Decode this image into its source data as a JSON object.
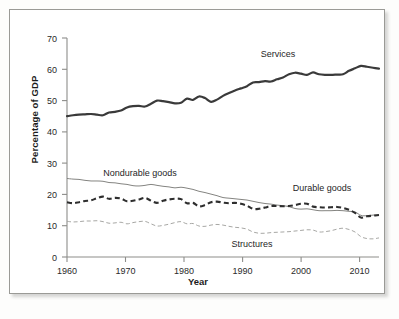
{
  "figure": {
    "title": "",
    "y_axis_title": "Percentage of GDP",
    "x_axis_title": "Year"
  },
  "labels": {
    "services": "Services",
    "nondurable": "Nondurable goods",
    "durable": "Durable goods",
    "structures": "Structures"
  },
  "colors": {
    "services_line": "#3a3a3a",
    "durable_line": "#2e2e2e",
    "nondurable_line": "#848481",
    "structures_line": "#9d9d9a",
    "axis": "#8d8d8a",
    "frame_border": "#9a9a96",
    "background": "#ffffff"
  },
  "axes": {
    "y_ticks": [
      "0",
      "10",
      "20",
      "30",
      "40",
      "50",
      "60",
      "70"
    ],
    "x_ticks": [
      "1960",
      "1970",
      "1980",
      "1990",
      "2000",
      "2010"
    ]
  },
  "chart_data": {
    "type": "line",
    "title": "",
    "xlabel": "Year",
    "ylabel": "Percentage of GDP",
    "xlim": [
      1960,
      2012
    ],
    "ylim": [
      0,
      70
    ],
    "grid": false,
    "legend": "inline-annotations",
    "x": [
      1960,
      1961,
      1962,
      1963,
      1964,
      1965,
      1966,
      1967,
      1968,
      1969,
      1970,
      1971,
      1972,
      1973,
      1974,
      1975,
      1976,
      1977,
      1978,
      1979,
      1980,
      1981,
      1982,
      1983,
      1984,
      1985,
      1986,
      1987,
      1988,
      1989,
      1990,
      1991,
      1992,
      1993,
      1994,
      1995,
      1996,
      1997,
      1998,
      1999,
      2000,
      2001,
      2002,
      2003,
      2004,
      2005,
      2006,
      2007,
      2008,
      2009,
      2010,
      2011,
      2012
    ],
    "series": [
      {
        "name": "Services",
        "style": "thick-solid",
        "values": [
          45.0,
          45.3,
          45.5,
          45.6,
          45.7,
          45.5,
          45.3,
          46.2,
          46.4,
          46.8,
          47.8,
          48.2,
          48.3,
          48.1,
          49.0,
          50.0,
          49.8,
          49.5,
          49.1,
          49.3,
          50.6,
          50.2,
          51.3,
          50.8,
          49.6,
          50.3,
          51.5,
          52.4,
          53.2,
          53.9,
          54.6,
          55.8,
          55.9,
          56.2,
          56.1,
          56.8,
          57.4,
          58.4,
          58.9,
          58.6,
          58.2,
          59.0,
          58.4,
          58.2,
          58.2,
          58.3,
          58.4,
          59.5,
          60.3,
          61.1,
          60.8,
          60.5,
          60.2
        ]
      },
      {
        "name": "Nondurable goods",
        "style": "thin-solid",
        "values": [
          25.1,
          24.9,
          24.8,
          24.5,
          24.3,
          24.3,
          24.2,
          23.8,
          23.7,
          23.4,
          23.2,
          22.8,
          22.7,
          22.9,
          23.2,
          22.9,
          22.6,
          22.4,
          22.1,
          22.3,
          22.0,
          21.6,
          21.0,
          20.6,
          20.1,
          19.6,
          19.0,
          18.8,
          18.6,
          18.4,
          18.2,
          17.8,
          17.4,
          17.1,
          16.9,
          16.6,
          16.4,
          16.1,
          15.5,
          15.3,
          15.4,
          15.1,
          14.8,
          14.8,
          14.8,
          14.9,
          14.8,
          14.6,
          14.4,
          13.3,
          13.2,
          13.4,
          13.5
        ]
      },
      {
        "name": "Durable goods",
        "style": "thick-dashed",
        "values": [
          17.5,
          17.2,
          17.5,
          17.9,
          18.1,
          18.8,
          19.3,
          18.6,
          18.9,
          18.7,
          17.8,
          18.0,
          18.4,
          18.9,
          18.0,
          17.3,
          18.0,
          18.4,
          18.6,
          18.5,
          17.2,
          17.3,
          16.2,
          16.6,
          17.5,
          17.7,
          17.4,
          17.2,
          17.3,
          17.0,
          16.4,
          15.4,
          15.4,
          15.8,
          16.3,
          16.3,
          16.2,
          16.3,
          16.6,
          17.0,
          17.0,
          16.1,
          15.9,
          15.8,
          15.9,
          16.0,
          15.7,
          15.1,
          14.1,
          12.6,
          13.0,
          13.2,
          13.4
        ]
      },
      {
        "name": "Structures",
        "style": "thin-dashed",
        "values": [
          11.4,
          11.2,
          11.3,
          11.5,
          11.5,
          11.6,
          11.3,
          10.8,
          10.9,
          11.1,
          10.6,
          11.0,
          11.3,
          11.4,
          10.6,
          9.9,
          10.1,
          10.5,
          11.0,
          11.3,
          10.6,
          10.7,
          9.9,
          9.8,
          10.2,
          10.4,
          10.2,
          9.8,
          9.5,
          9.3,
          8.9,
          8.0,
          7.6,
          7.6,
          7.8,
          7.9,
          8.0,
          8.1,
          8.3,
          8.5,
          8.7,
          8.6,
          8.0,
          8.1,
          8.4,
          8.9,
          9.2,
          8.8,
          8.0,
          6.5,
          5.9,
          5.8,
          6.1
        ]
      }
    ]
  }
}
